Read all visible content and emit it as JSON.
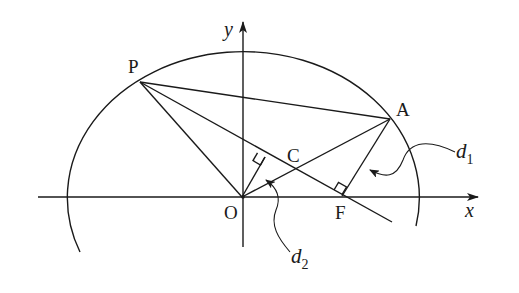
{
  "diagram": {
    "type": "geometry",
    "axes": {
      "x_label": "x",
      "y_label": "y"
    },
    "points": {
      "P": {
        "label": "P",
        "x": 140,
        "y": 82
      },
      "A": {
        "label": "A",
        "x": 390,
        "y": 119
      },
      "O": {
        "label": "O",
        "x": 242,
        "y": 197
      },
      "F": {
        "label": "F",
        "x": 342,
        "y": 197
      },
      "C": {
        "label": "C",
        "x": 295,
        "y": 170
      }
    },
    "distance_labels": {
      "d1": {
        "main": "d",
        "sub": "1"
      },
      "d2": {
        "main": "d",
        "sub": "2"
      }
    },
    "colors": {
      "stroke": "#1a1a1a",
      "background": "#ffffff"
    }
  }
}
